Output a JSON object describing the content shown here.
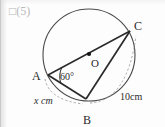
{
  "problem": {
    "label": "□(5)"
  },
  "figure": {
    "type": "circle-inscribed-triangle",
    "background_color": "#fdfdfd",
    "stroke_color": "#2a2a2a",
    "circle_stroke_color": "#4a4a4a",
    "dashed_stroke_color": "#8a8a8a",
    "circle": {
      "cx": 88,
      "cy": 55,
      "r": 46
    },
    "center_point": {
      "label": "O",
      "cx": 88,
      "cy": 54,
      "label_x": 90,
      "label_y": 66
    },
    "vertices": [
      {
        "name": "A",
        "x": 47,
        "y": 75,
        "label": "A",
        "label_x": 31,
        "label_y": 80
      },
      {
        "name": "B",
        "x": 85,
        "y": 99,
        "label": "B",
        "label_x": 82,
        "label_y": 124
      },
      {
        "name": "C",
        "x": 129,
        "y": 31,
        "label": "C",
        "label_x": 133,
        "label_y": 30
      }
    ],
    "segments": [
      {
        "from": "A",
        "to": "C",
        "note": "diameter through O"
      },
      {
        "from": "A",
        "to": "B"
      },
      {
        "from": "B",
        "to": "C"
      }
    ],
    "angle_marks": [
      {
        "at": "A",
        "label": "60°",
        "label_x": 58,
        "label_y": 79
      }
    ],
    "measure_labels": [
      {
        "label": "x cm",
        "side": "AB",
        "label_x": 36,
        "label_y": 103,
        "italic_part": "x"
      },
      {
        "label": "10cm",
        "side": "BC",
        "label_x": 122,
        "label_y": 99,
        "italic_part": ""
      }
    ]
  }
}
